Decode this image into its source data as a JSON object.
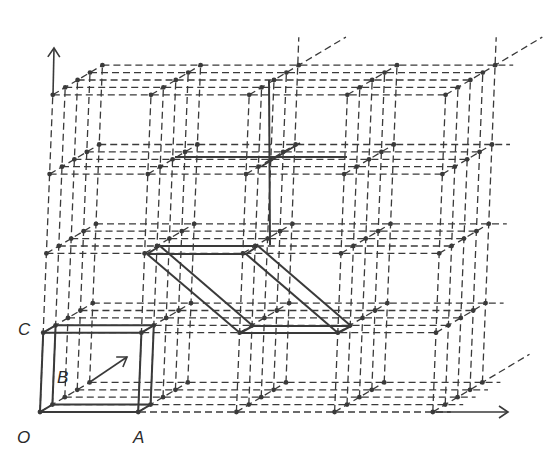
{
  "diagram": {
    "colors": {
      "line": "#3a3a3a",
      "background": "#ffffff"
    },
    "lattice": {
      "columns": 5,
      "rows": 5,
      "layers": 5,
      "origin": [
        40,
        412
      ],
      "a_vector": [
        98.2,
        0
      ],
      "c_vector": [
        3.2,
        -79.3
      ],
      "b_vector": [
        12.4,
        -7.4
      ],
      "dash": "7,4"
    },
    "labels": [
      {
        "id": "O",
        "text": "O",
        "x": 17,
        "y": 442
      },
      {
        "id": "A",
        "text": "A",
        "x": 133,
        "y": 442
      },
      {
        "id": "B",
        "text": "B",
        "x": 58,
        "y": 388
      },
      {
        "id": "C",
        "text": "C",
        "x": 18,
        "y": 338
      }
    ],
    "unit_cell": {
      "name": "primitive unit cell OABC",
      "corners_lattice": [
        [
          0,
          0,
          0
        ],
        [
          1,
          0,
          0
        ],
        [
          1,
          1,
          0
        ],
        [
          0,
          1,
          0
        ]
      ],
      "extrude_layers": 1
    },
    "sheared_cell": {
      "name": "alternative (sheared) unit cell",
      "front": [
        [
          147,
          254
        ],
        [
          246,
          254
        ],
        [
          338,
          333
        ],
        [
          240,
          333
        ]
      ],
      "back": [
        [
          160,
          246
        ],
        [
          258,
          246
        ],
        [
          351,
          326
        ],
        [
          253,
          326
        ]
      ]
    },
    "solid_lines": [
      {
        "name": "vertical-bond",
        "from": [
          269,
          80
        ],
        "to": [
          270,
          245
        ]
      },
      {
        "name": "horizontal-bond",
        "from": [
          175,
          157
        ],
        "to": [
          347,
          157
        ]
      },
      {
        "name": "depth-bond",
        "from": [
          262,
          166
        ],
        "to": [
          300,
          143
        ]
      }
    ],
    "arrows": [
      {
        "name": "b-axis-arrow",
        "from": [
          90,
          382
        ],
        "to": [
          127,
          357
        ]
      },
      {
        "name": "c-axis-arrow",
        "from": [
          53,
          95
        ],
        "to": [
          54,
          48
        ]
      },
      {
        "name": "a-axis-arrow",
        "from": [
          433,
          412
        ],
        "to": [
          508,
          412
        ]
      }
    ]
  }
}
